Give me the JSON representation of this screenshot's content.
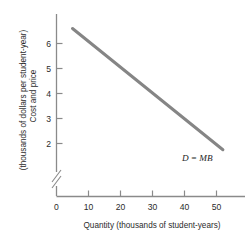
{
  "chart_data": {
    "type": "line",
    "title": "",
    "xlabel": "Quantity (thousands of student-years)",
    "ylabel_line1": "Cost and price",
    "ylabel_line2": "(thousands of dollars per student-year)",
    "xlim": [
      0,
      57
    ],
    "ylim": [
      1.5,
      6.8
    ],
    "xticks": [
      0,
      10,
      20,
      30,
      40,
      50
    ],
    "xtick_labels": [
      "0",
      "10",
      "20",
      "30",
      "40",
      "50"
    ],
    "yticks": [
      2,
      3,
      4,
      5,
      6
    ],
    "ytick_labels": [
      "2",
      "3",
      "4",
      "5",
      "6"
    ],
    "y_axis_break": true,
    "y_axis_break_note": "double-slash break between 0 and 2",
    "grid": false,
    "legend_position": "inline-right",
    "series": [
      {
        "name": "D = MB",
        "label": "D = MB",
        "color": "#858585",
        "line_width_px": 3,
        "x": [
          5,
          52
        ],
        "y": [
          6.6,
          1.75
        ],
        "points": [
          {
            "x": 5,
            "y": 6.6
          },
          {
            "x": 10,
            "y": 6.1
          },
          {
            "x": 20,
            "y": 5.0
          },
          {
            "x": 30,
            "y": 4.0
          },
          {
            "x": 40,
            "y": 2.95
          },
          {
            "x": 50,
            "y": 1.95
          },
          {
            "x": 52,
            "y": 1.75
          }
        ]
      }
    ],
    "annotations": [
      {
        "text": "D = MB",
        "x": 44,
        "y": 1.3,
        "style": "italic"
      }
    ]
  },
  "colors": {
    "axis": "#8a8a8a",
    "curve": "#858585",
    "text": "#2b2b2b",
    "background": "#ffffff"
  }
}
